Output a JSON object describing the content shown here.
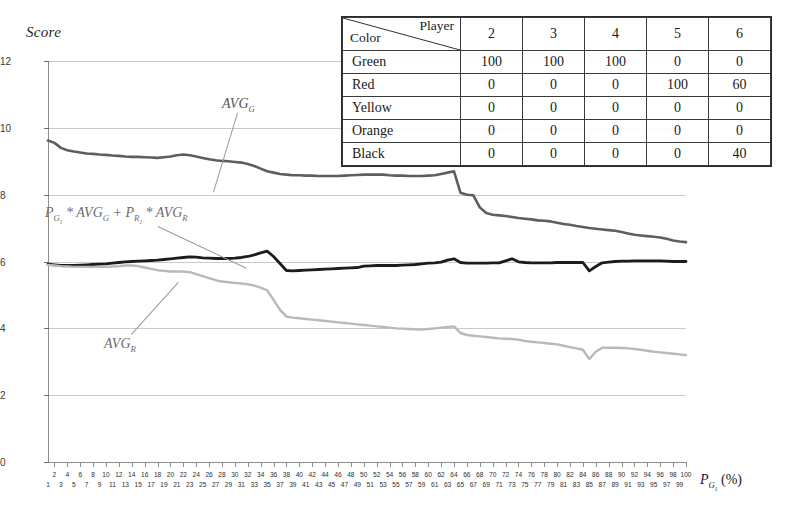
{
  "chart_data": {
    "type": "line",
    "title": "",
    "ylabel": "Score",
    "xlabel": "P_G1 (%)",
    "xlabel_parts": {
      "base": "P",
      "sub": "G",
      "sub2": "1",
      "unit": "(%)"
    },
    "ylim": [
      0,
      12
    ],
    "xlim": [
      1,
      100
    ],
    "yticks": [
      0,
      2,
      4,
      6,
      8,
      10,
      12
    ],
    "grid": true,
    "legend_position": "annotations-inline",
    "xticks_even": [
      2,
      4,
      6,
      8,
      10,
      12,
      14,
      16,
      18,
      20,
      22,
      24,
      26,
      28,
      30,
      32,
      34,
      36,
      38,
      40,
      42,
      44,
      46,
      48,
      50,
      52,
      54,
      56,
      58,
      60,
      62,
      64,
      66,
      68,
      70,
      72,
      74,
      76,
      78,
      80,
      82,
      84,
      86,
      88,
      90,
      92,
      94,
      96,
      98,
      100
    ],
    "xticks_odd": [
      1,
      3,
      5,
      7,
      9,
      11,
      13,
      15,
      17,
      19,
      21,
      23,
      25,
      27,
      29,
      31,
      33,
      35,
      37,
      39,
      41,
      43,
      45,
      47,
      49,
      51,
      53,
      55,
      57,
      59,
      61,
      63,
      65,
      67,
      69,
      71,
      73,
      75,
      77,
      79,
      81,
      83,
      85,
      87,
      89,
      91,
      93,
      95,
      97,
      99
    ],
    "series": [
      {
        "name": "AVG_G",
        "color": "#5e5e5e",
        "width": 2.6,
        "x": [
          1,
          2,
          3,
          4,
          5,
          6,
          7,
          8,
          9,
          10,
          11,
          12,
          13,
          14,
          15,
          16,
          17,
          18,
          19,
          20,
          21,
          22,
          23,
          24,
          25,
          26,
          27,
          28,
          29,
          30,
          31,
          32,
          33,
          34,
          35,
          36,
          37,
          38,
          39,
          40,
          41,
          42,
          43,
          44,
          45,
          46,
          47,
          48,
          49,
          50,
          51,
          52,
          53,
          54,
          55,
          56,
          57,
          58,
          59,
          60,
          61,
          62,
          63,
          64,
          65,
          66,
          67,
          68,
          69,
          70,
          71,
          72,
          73,
          74,
          75,
          76,
          77,
          78,
          79,
          80,
          81,
          82,
          83,
          84,
          85,
          86,
          87,
          88,
          89,
          90,
          91,
          92,
          93,
          94,
          95,
          96,
          97,
          98,
          99,
          100
        ],
        "y": [
          9.62,
          9.55,
          9.4,
          9.33,
          9.29,
          9.26,
          9.23,
          9.22,
          9.2,
          9.19,
          9.17,
          9.16,
          9.14,
          9.13,
          9.13,
          9.12,
          9.11,
          9.1,
          9.12,
          9.14,
          9.18,
          9.2,
          9.18,
          9.14,
          9.1,
          9.06,
          9.03,
          9.01,
          9.0,
          8.98,
          8.96,
          8.92,
          8.86,
          8.78,
          8.7,
          8.66,
          8.62,
          8.6,
          8.58,
          8.58,
          8.57,
          8.57,
          8.56,
          8.56,
          8.56,
          8.56,
          8.57,
          8.58,
          8.59,
          8.6,
          8.6,
          8.6,
          8.6,
          8.58,
          8.57,
          8.57,
          8.56,
          8.56,
          8.56,
          8.57,
          8.58,
          8.62,
          8.66,
          8.7,
          8.06,
          8.0,
          7.98,
          7.62,
          7.45,
          7.4,
          7.38,
          7.36,
          7.33,
          7.3,
          7.28,
          7.26,
          7.23,
          7.22,
          7.2,
          7.16,
          7.12,
          7.1,
          7.06,
          7.03,
          7.0,
          6.98,
          6.96,
          6.94,
          6.92,
          6.88,
          6.84,
          6.8,
          6.78,
          6.76,
          6.74,
          6.72,
          6.68,
          6.63,
          6.6,
          6.58
        ]
      },
      {
        "name": "P_G1*AVG_G + P_R1*AVG_R",
        "color": "#1c1c1c",
        "width": 2.8,
        "x": [
          1,
          2,
          3,
          4,
          5,
          6,
          7,
          8,
          9,
          10,
          11,
          12,
          13,
          14,
          15,
          16,
          17,
          18,
          19,
          20,
          21,
          22,
          23,
          24,
          25,
          26,
          27,
          28,
          29,
          30,
          31,
          32,
          33,
          34,
          35,
          36,
          37,
          38,
          39,
          40,
          41,
          42,
          43,
          44,
          45,
          46,
          47,
          48,
          49,
          50,
          51,
          52,
          53,
          54,
          55,
          56,
          57,
          58,
          59,
          60,
          61,
          62,
          63,
          64,
          65,
          66,
          67,
          68,
          69,
          70,
          71,
          72,
          73,
          74,
          75,
          76,
          77,
          78,
          79,
          80,
          81,
          82,
          83,
          84,
          85,
          86,
          87,
          88,
          89,
          90,
          91,
          92,
          93,
          94,
          95,
          96,
          97,
          98,
          99,
          100
        ],
        "y": [
          5.92,
          5.9,
          5.88,
          5.88,
          5.88,
          5.89,
          5.9,
          5.91,
          5.92,
          5.93,
          5.95,
          5.97,
          5.99,
          6.0,
          6.01,
          6.02,
          6.03,
          6.04,
          6.06,
          6.08,
          6.1,
          6.12,
          6.14,
          6.13,
          6.11,
          6.1,
          6.09,
          6.09,
          6.09,
          6.1,
          6.12,
          6.15,
          6.2,
          6.26,
          6.31,
          6.15,
          5.94,
          5.73,
          5.72,
          5.73,
          5.74,
          5.75,
          5.76,
          5.77,
          5.78,
          5.79,
          5.8,
          5.81,
          5.82,
          5.86,
          5.87,
          5.88,
          5.88,
          5.88,
          5.88,
          5.89,
          5.9,
          5.91,
          5.93,
          5.95,
          5.96,
          5.98,
          6.04,
          6.08,
          5.97,
          5.95,
          5.95,
          5.95,
          5.95,
          5.96,
          5.96,
          6.02,
          6.08,
          5.99,
          5.97,
          5.96,
          5.96,
          5.96,
          5.96,
          5.97,
          5.97,
          5.97,
          5.97,
          5.97,
          5.72,
          5.85,
          5.96,
          5.98,
          6.0,
          6.01,
          6.01,
          6.02,
          6.02,
          6.02,
          6.02,
          6.02,
          6.01,
          6.0,
          6.0,
          6.0
        ]
      },
      {
        "name": "AVG_R",
        "color": "#b9b9b9",
        "width": 2.4,
        "x": [
          1,
          2,
          3,
          4,
          5,
          6,
          7,
          8,
          9,
          10,
          11,
          12,
          13,
          14,
          15,
          16,
          17,
          18,
          19,
          20,
          21,
          22,
          23,
          24,
          25,
          26,
          27,
          28,
          29,
          30,
          31,
          32,
          33,
          34,
          35,
          36,
          37,
          38,
          39,
          40,
          41,
          42,
          43,
          44,
          45,
          46,
          47,
          48,
          49,
          50,
          51,
          52,
          53,
          54,
          55,
          56,
          57,
          58,
          59,
          60,
          61,
          62,
          63,
          64,
          65,
          66,
          67,
          68,
          69,
          70,
          71,
          72,
          73,
          74,
          75,
          76,
          77,
          78,
          79,
          80,
          81,
          82,
          83,
          84,
          85,
          86,
          87,
          88,
          89,
          90,
          91,
          92,
          93,
          94,
          95,
          96,
          97,
          98,
          99,
          100
        ],
        "y": [
          5.9,
          5.88,
          5.86,
          5.85,
          5.84,
          5.84,
          5.84,
          5.84,
          5.84,
          5.84,
          5.85,
          5.86,
          5.88,
          5.88,
          5.86,
          5.82,
          5.78,
          5.74,
          5.72,
          5.7,
          5.7,
          5.7,
          5.68,
          5.62,
          5.56,
          5.5,
          5.44,
          5.4,
          5.38,
          5.36,
          5.34,
          5.32,
          5.28,
          5.22,
          5.14,
          4.85,
          4.55,
          4.35,
          4.32,
          4.3,
          4.28,
          4.26,
          4.24,
          4.22,
          4.2,
          4.18,
          4.16,
          4.14,
          4.12,
          4.1,
          4.08,
          4.06,
          4.04,
          4.02,
          4.0,
          3.99,
          3.98,
          3.97,
          3.96,
          3.98,
          4.0,
          4.02,
          4.04,
          4.06,
          3.86,
          3.8,
          3.78,
          3.76,
          3.74,
          3.72,
          3.7,
          3.69,
          3.68,
          3.66,
          3.62,
          3.6,
          3.58,
          3.56,
          3.54,
          3.52,
          3.48,
          3.44,
          3.4,
          3.36,
          3.08,
          3.3,
          3.42,
          3.42,
          3.42,
          3.41,
          3.4,
          3.38,
          3.36,
          3.33,
          3.3,
          3.28,
          3.26,
          3.24,
          3.22,
          3.2
        ]
      }
    ],
    "annotations": [
      {
        "id": "avgg",
        "text": "AVG",
        "sub": "G"
      },
      {
        "id": "mix",
        "text": "P",
        "sub": "G1"
      },
      {
        "id": "avgr",
        "text": "AVG",
        "sub": "R"
      }
    ]
  },
  "axis": {
    "y_title": "Score",
    "y_ticks": [
      "0",
      "2",
      "4",
      "6",
      "8",
      "10",
      "12"
    ]
  },
  "annotations": {
    "avg_g": "AVGG",
    "mix": "PG1 * AVGG + PR1 * AVGR",
    "avg_r": "AVGR"
  },
  "table": {
    "corner_row_label": "Color",
    "corner_col_label": "Player",
    "columns": [
      "2",
      "3",
      "4",
      "5",
      "6"
    ],
    "rows": [
      {
        "label": "Green",
        "values": [
          "100",
          "100",
          "100",
          "0",
          "0"
        ]
      },
      {
        "label": "Red",
        "values": [
          "0",
          "0",
          "0",
          "100",
          "60"
        ]
      },
      {
        "label": "Yellow",
        "values": [
          "0",
          "0",
          "0",
          "0",
          "0"
        ]
      },
      {
        "label": "Orange",
        "values": [
          "0",
          "0",
          "0",
          "0",
          "0"
        ]
      },
      {
        "label": "Black",
        "values": [
          "0",
          "0",
          "0",
          "0",
          "40"
        ]
      }
    ]
  },
  "colors": {
    "avg_g": "#5e5e5e",
    "mix": "#1c1c1c",
    "avg_r": "#b9b9b9",
    "grid": "#c9c9c9",
    "axis": "#8e8e8e"
  }
}
